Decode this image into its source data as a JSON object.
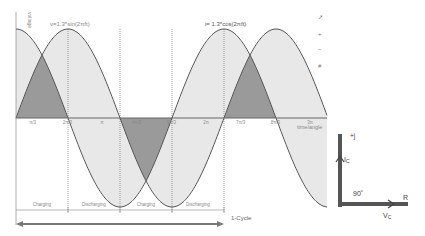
{
  "chart_data": {
    "type": "line",
    "title": "",
    "xlabel": "time/angle",
    "ylabel": "voltage",
    "series": [
      {
        "name": "v=1.3*sin(2πft)",
        "amplitude": 1.3,
        "function": "sin"
      },
      {
        "name": "i= 1.3*cos(2πft)",
        "amplitude": 1.3,
        "function": "cos"
      }
    ],
    "x_ticks": [
      "π/3",
      "2π/3",
      "π",
      "4π/3",
      "5π/3",
      "2π",
      "7π/3",
      "8π/3",
      "3π"
    ],
    "phase_regions": [
      "Charging",
      "Discharging",
      "Charging",
      "Discharging"
    ],
    "cycle_label": "1-Cycle",
    "grid": false
  },
  "labels": {
    "y_axis": "voltage",
    "x_axis": "time/angle",
    "v_curve": "v=1.3*sin(2πft)",
    "i_curve": "i= 1.3*cos(2πft)",
    "regions": [
      "Charging",
      "Discharging",
      "Charging",
      "Discharging"
    ],
    "cycle": "1-Cycle",
    "ticks": [
      "π/3",
      "2π/3",
      "π",
      "4π/3",
      "5π/3",
      "2π",
      "7π/3",
      "8π/3",
      "3π"
    ]
  },
  "toolbar": {
    "icons": [
      "pointer",
      "+",
      "−",
      "#"
    ]
  },
  "phasor": {
    "imag_axis": "+j",
    "real_axis": "R",
    "ic_label": "I",
    "ic_sub": "C",
    "vc_label": "V",
    "vc_sub": "C",
    "angle": "90˚"
  },
  "colors": {
    "curve_line": "#555555",
    "fill_light": "#e4e4e4",
    "fill_mid": "#cfcfcf",
    "fill_dark": "#9a9a9a",
    "phasor": "#555555"
  }
}
